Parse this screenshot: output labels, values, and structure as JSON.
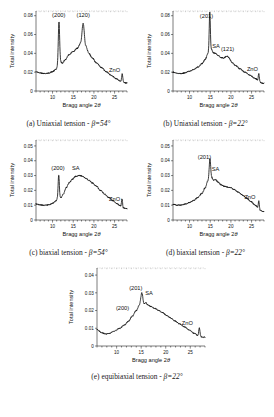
{
  "figure": {
    "axis_labels": {
      "x": "Bragg angle 2",
      "x_symbol": "θ",
      "y": "Total intensity"
    }
  },
  "chart_data": [
    {
      "id": "a",
      "type": "line",
      "title": "(a) Uniaxial tension - β=54°",
      "caption_prefix": "(a) Uniaxial tension - ",
      "caption_beta": "β=54°",
      "xlabel": "Bragg angle 2θ",
      "ylabel": "Total intensity",
      "xlim": [
        6,
        28
      ],
      "ylim": [
        0,
        0.085
      ],
      "xticks": [
        10,
        15,
        20,
        25
      ],
      "yticks": [
        0,
        0.02,
        0.04,
        0.06,
        0.08
      ],
      "ytick_labels": [
        "0",
        "0.02",
        "0.04",
        "0.06",
        "0.08"
      ],
      "grid": false,
      "annotations": [
        {
          "text": "(200)",
          "x": 11.5,
          "y": 0.079
        },
        {
          "text": "(120)",
          "x": 17.4,
          "y": 0.079
        },
        {
          "text": "ZnO",
          "x": 25.0,
          "y": 0.02
        }
      ],
      "baseline": [
        {
          "x": 6.0,
          "y": 0.0205
        },
        {
          "x": 7.0,
          "y": 0.0192
        },
        {
          "x": 8.0,
          "y": 0.0185
        },
        {
          "x": 9.0,
          "y": 0.019
        },
        {
          "x": 10.0,
          "y": 0.0205
        },
        {
          "x": 10.8,
          "y": 0.023
        },
        {
          "x": 11.3,
          "y": 0.0265
        },
        {
          "x": 11.9,
          "y": 0.031
        },
        {
          "x": 12.4,
          "y": 0.0295
        },
        {
          "x": 13.0,
          "y": 0.033
        },
        {
          "x": 14.0,
          "y": 0.0385
        },
        {
          "x": 15.0,
          "y": 0.042
        },
        {
          "x": 16.0,
          "y": 0.0455
        },
        {
          "x": 16.8,
          "y": 0.051
        },
        {
          "x": 17.4,
          "y": 0.066
        },
        {
          "x": 18.0,
          "y": 0.048
        },
        {
          "x": 18.8,
          "y": 0.04
        },
        {
          "x": 19.6,
          "y": 0.035
        },
        {
          "x": 20.6,
          "y": 0.03
        },
        {
          "x": 21.8,
          "y": 0.025
        },
        {
          "x": 23.0,
          "y": 0.0205
        },
        {
          "x": 24.2,
          "y": 0.0165
        },
        {
          "x": 25.4,
          "y": 0.013
        },
        {
          "x": 26.4,
          "y": 0.0105
        },
        {
          "x": 27.0,
          "y": 0.0095
        },
        {
          "x": 27.6,
          "y": 0.0085
        }
      ],
      "peaks": [
        {
          "x": 11.55,
          "height": 0.0455,
          "width": 0.16,
          "label": "(200)"
        },
        {
          "x": 17.42,
          "height": 0.0055,
          "width": 0.3,
          "label": "(120)"
        },
        {
          "x": 26.85,
          "height": 0.0085,
          "width": 0.13,
          "label": "ZnO"
        }
      ]
    },
    {
      "id": "b",
      "type": "line",
      "title": "(b) Uniaxial tension - β=22°",
      "caption_prefix": "(b) Uniaxial tension - ",
      "caption_beta": "β=22°",
      "xlabel": "Bragg angle 2θ",
      "ylabel": "Total intensity",
      "xlim": [
        6,
        28
      ],
      "ylim": [
        0,
        0.085
      ],
      "xticks": [
        10,
        15,
        20,
        25
      ],
      "yticks": [
        0,
        0.02,
        0.04,
        0.06,
        0.08
      ],
      "ytick_labels": [
        "0",
        "0.02",
        "0.04",
        "0.06",
        "0.08"
      ],
      "grid": false,
      "annotations": [
        {
          "text": "(201)",
          "x": 14.1,
          "y": 0.0775
        },
        {
          "text": "SA",
          "x": 16.4,
          "y": 0.0455
        },
        {
          "text": "(121)",
          "x": 19.2,
          "y": 0.042
        },
        {
          "text": "ZnO",
          "x": 25.2,
          "y": 0.0215
        }
      ],
      "baseline": [
        {
          "x": 6.0,
          "y": 0.02
        },
        {
          "x": 7.0,
          "y": 0.0188
        },
        {
          "x": 8.0,
          "y": 0.0185
        },
        {
          "x": 9.0,
          "y": 0.0195
        },
        {
          "x": 10.0,
          "y": 0.021
        },
        {
          "x": 11.0,
          "y": 0.0228
        },
        {
          "x": 12.0,
          "y": 0.0255
        },
        {
          "x": 13.0,
          "y": 0.029
        },
        {
          "x": 13.8,
          "y": 0.0335
        },
        {
          "x": 14.4,
          "y": 0.0395
        },
        {
          "x": 14.85,
          "y": 0.047
        },
        {
          "x": 15.3,
          "y": 0.044
        },
        {
          "x": 15.8,
          "y": 0.0405
        },
        {
          "x": 16.3,
          "y": 0.04
        },
        {
          "x": 16.9,
          "y": 0.0378
        },
        {
          "x": 17.6,
          "y": 0.0355
        },
        {
          "x": 18.3,
          "y": 0.0345
        },
        {
          "x": 19.0,
          "y": 0.0352
        },
        {
          "x": 19.6,
          "y": 0.034
        },
        {
          "x": 20.3,
          "y": 0.03
        },
        {
          "x": 21.2,
          "y": 0.0268
        },
        {
          "x": 22.2,
          "y": 0.0235
        },
        {
          "x": 23.4,
          "y": 0.02
        },
        {
          "x": 24.6,
          "y": 0.0168
        },
        {
          "x": 25.8,
          "y": 0.0135
        },
        {
          "x": 26.6,
          "y": 0.0112
        },
        {
          "x": 27.2,
          "y": 0.009
        },
        {
          "x": 27.7,
          "y": 0.0082
        }
      ],
      "peaks": [
        {
          "x": 14.9,
          "height": 0.037,
          "width": 0.13,
          "label": "(201)"
        },
        {
          "x": 19.05,
          "height": 0.002,
          "width": 0.45,
          "label": "(121)"
        },
        {
          "x": 26.75,
          "height": 0.0075,
          "width": 0.13,
          "label": "ZnO"
        }
      ]
    },
    {
      "id": "c",
      "type": "line",
      "title": "(c) biaxial tension - β=54°",
      "caption_prefix": "(c) biaxial tension - ",
      "caption_beta": "β=54°",
      "xlabel": "Bragg angle 2θ",
      "ylabel": "Total intensity",
      "xlim": [
        6,
        28
      ],
      "ylim": [
        0,
        0.054
      ],
      "xticks": [
        10,
        15,
        20,
        25
      ],
      "yticks": [
        0,
        0.01,
        0.02,
        0.03,
        0.04,
        0.05
      ],
      "ytick_labels": [
        "0",
        "0.01",
        "0.02",
        "0.03",
        "0.04",
        "0.05"
      ],
      "grid": false,
      "annotations": [
        {
          "text": "(200)",
          "x": 11.3,
          "y": 0.0335
        },
        {
          "text": "SA",
          "x": 15.6,
          "y": 0.034
        },
        {
          "text": "ZnO",
          "x": 25.0,
          "y": 0.0128
        }
      ],
      "baseline": [
        {
          "x": 6.0,
          "y": 0.0108
        },
        {
          "x": 7.0,
          "y": 0.0102
        },
        {
          "x": 8.0,
          "y": 0.01
        },
        {
          "x": 9.0,
          "y": 0.0102
        },
        {
          "x": 10.0,
          "y": 0.0112
        },
        {
          "x": 10.8,
          "y": 0.0128
        },
        {
          "x": 11.4,
          "y": 0.0155
        },
        {
          "x": 12.0,
          "y": 0.015
        },
        {
          "x": 12.6,
          "y": 0.0175
        },
        {
          "x": 13.3,
          "y": 0.0218
        },
        {
          "x": 14.0,
          "y": 0.025
        },
        {
          "x": 14.8,
          "y": 0.0275
        },
        {
          "x": 15.6,
          "y": 0.0295
        },
        {
          "x": 16.4,
          "y": 0.03
        },
        {
          "x": 17.2,
          "y": 0.0296
        },
        {
          "x": 18.0,
          "y": 0.0283
        },
        {
          "x": 18.8,
          "y": 0.0268
        },
        {
          "x": 19.6,
          "y": 0.025
        },
        {
          "x": 20.6,
          "y": 0.0228
        },
        {
          "x": 21.6,
          "y": 0.02
        },
        {
          "x": 22.6,
          "y": 0.0175
        },
        {
          "x": 23.6,
          "y": 0.0152
        },
        {
          "x": 24.6,
          "y": 0.013
        },
        {
          "x": 25.6,
          "y": 0.011
        },
        {
          "x": 26.4,
          "y": 0.0095
        },
        {
          "x": 27.0,
          "y": 0.0082
        },
        {
          "x": 27.6,
          "y": 0.0078
        }
      ],
      "peaks": [
        {
          "x": 11.5,
          "height": 0.015,
          "width": 0.14,
          "label": "(200)"
        },
        {
          "x": 26.8,
          "height": 0.006,
          "width": 0.12,
          "label": "ZnO"
        }
      ]
    },
    {
      "id": "d",
      "type": "line",
      "title": "(d) biaxial tension - β=22°",
      "caption_prefix": "(d) biaxial tension - ",
      "caption_beta": "β=22°",
      "xlabel": "Bragg angle 2θ",
      "ylabel": "Total intensity",
      "xlim": [
        6,
        28
      ],
      "ylim": [
        0,
        0.054
      ],
      "xticks": [
        10,
        15,
        20,
        25
      ],
      "yticks": [
        0,
        0.01,
        0.02,
        0.03,
        0.04,
        0.05
      ],
      "ytick_labels": [
        "0",
        "0.01",
        "0.02",
        "0.03",
        "0.04",
        "0.05"
      ],
      "grid": false,
      "annotations": [
        {
          "text": "(201)",
          "x": 13.6,
          "y": 0.0415
        },
        {
          "text": "SA",
          "x": 16.3,
          "y": 0.033
        },
        {
          "text": "ZnO",
          "x": 24.6,
          "y": 0.0145
        }
      ],
      "baseline": [
        {
          "x": 6.0,
          "y": 0.0106
        },
        {
          "x": 7.0,
          "y": 0.01
        },
        {
          "x": 8.0,
          "y": 0.0101
        },
        {
          "x": 9.0,
          "y": 0.0108
        },
        {
          "x": 10.0,
          "y": 0.0118
        },
        {
          "x": 11.0,
          "y": 0.0132
        },
        {
          "x": 12.0,
          "y": 0.0152
        },
        {
          "x": 13.0,
          "y": 0.018
        },
        {
          "x": 13.8,
          "y": 0.0218
        },
        {
          "x": 14.4,
          "y": 0.0262
        },
        {
          "x": 14.9,
          "y": 0.032
        },
        {
          "x": 15.3,
          "y": 0.029
        },
        {
          "x": 15.8,
          "y": 0.0268
        },
        {
          "x": 16.3,
          "y": 0.0272
        },
        {
          "x": 16.9,
          "y": 0.0255
        },
        {
          "x": 17.6,
          "y": 0.0238
        },
        {
          "x": 18.4,
          "y": 0.0228
        },
        {
          "x": 19.2,
          "y": 0.0222
        },
        {
          "x": 20.0,
          "y": 0.0218
        },
        {
          "x": 20.8,
          "y": 0.0205
        },
        {
          "x": 21.8,
          "y": 0.0188
        },
        {
          "x": 22.8,
          "y": 0.0168
        },
        {
          "x": 23.8,
          "y": 0.0148
        },
        {
          "x": 24.8,
          "y": 0.0125
        },
        {
          "x": 25.8,
          "y": 0.0102
        },
        {
          "x": 26.5,
          "y": 0.0085
        },
        {
          "x": 27.1,
          "y": 0.0065
        },
        {
          "x": 27.7,
          "y": 0.0058
        }
      ],
      "peaks": [
        {
          "x": 14.95,
          "height": 0.0095,
          "width": 0.16,
          "label": "(201)"
        },
        {
          "x": 26.75,
          "height": 0.005,
          "width": 0.12,
          "label": "ZnO"
        }
      ]
    },
    {
      "id": "e",
      "type": "line",
      "title": "(e) equibiaxial tension - β=22°",
      "caption_prefix": "(e) equibiaxial tension - ",
      "caption_beta": "β=22°",
      "xlabel": "Bragg angle 2θ",
      "ylabel": "Total intensity",
      "xlim": [
        6,
        28
      ],
      "ylim": [
        0,
        0.044
      ],
      "xticks": [
        10,
        15,
        20,
        25
      ],
      "yticks": [
        0,
        0.01,
        0.02,
        0.03,
        0.04
      ],
      "ytick_labels": [
        "0",
        "0.01",
        "0.02",
        "0.03",
        "0.04"
      ],
      "grid": false,
      "annotations": [
        {
          "text": "(200)",
          "x": 11.2,
          "y": 0.0205
        },
        {
          "text": "(201)",
          "x": 13.9,
          "y": 0.0318
        },
        {
          "text": "SA",
          "x": 16.6,
          "y": 0.029
        },
        {
          "text": "ZnO",
          "x": 24.4,
          "y": 0.0118
        }
      ],
      "baseline": [
        {
          "x": 6.0,
          "y": 0.0092
        },
        {
          "x": 7.0,
          "y": 0.0075
        },
        {
          "x": 7.8,
          "y": 0.0068
        },
        {
          "x": 8.6,
          "y": 0.0072
        },
        {
          "x": 9.6,
          "y": 0.0085
        },
        {
          "x": 10.6,
          "y": 0.01
        },
        {
          "x": 11.6,
          "y": 0.0118
        },
        {
          "x": 12.4,
          "y": 0.014
        },
        {
          "x": 13.2,
          "y": 0.0168
        },
        {
          "x": 14.0,
          "y": 0.02
        },
        {
          "x": 14.6,
          "y": 0.0228
        },
        {
          "x": 15.1,
          "y": 0.0252
        },
        {
          "x": 15.5,
          "y": 0.0232
        },
        {
          "x": 15.9,
          "y": 0.0245
        },
        {
          "x": 16.4,
          "y": 0.0232
        },
        {
          "x": 17.0,
          "y": 0.0222
        },
        {
          "x": 17.8,
          "y": 0.0212
        },
        {
          "x": 18.6,
          "y": 0.02
        },
        {
          "x": 19.4,
          "y": 0.0188
        },
        {
          "x": 20.2,
          "y": 0.0172
        },
        {
          "x": 21.0,
          "y": 0.0158
        },
        {
          "x": 21.8,
          "y": 0.0142
        },
        {
          "x": 22.8,
          "y": 0.0125
        },
        {
          "x": 23.8,
          "y": 0.0108
        },
        {
          "x": 24.8,
          "y": 0.009
        },
        {
          "x": 25.8,
          "y": 0.0072
        },
        {
          "x": 26.5,
          "y": 0.006
        },
        {
          "x": 27.1,
          "y": 0.0052
        },
        {
          "x": 27.7,
          "y": 0.005
        }
      ],
      "peaks": [
        {
          "x": 15.15,
          "height": 0.0048,
          "width": 0.22,
          "label": "(201)"
        },
        {
          "x": 26.85,
          "height": 0.0048,
          "width": 0.12,
          "label": "ZnO"
        }
      ]
    }
  ]
}
